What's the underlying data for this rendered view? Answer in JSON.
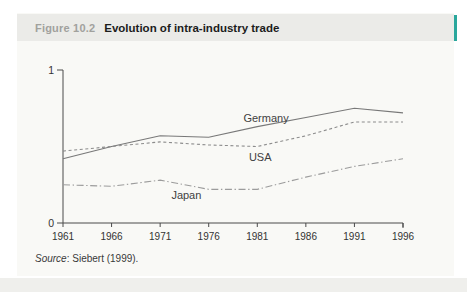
{
  "header": {
    "figure_label": "Figure 10.2",
    "title": "Evolution of intra-industry trade"
  },
  "source": {
    "label": "Source",
    "rest": ": Siebert (1999)."
  },
  "colors": {
    "accent_teal": "#2aa79c",
    "header_bg": "#ebebe8",
    "card_bg": "#f9f9f6",
    "axis": "#4a4a4a",
    "tick_label": "#333333",
    "series_label": "#3f3f3f"
  },
  "chart_data": {
    "type": "line",
    "title": "Evolution of intra-industry trade",
    "xlabel": "",
    "ylabel": "",
    "categories": [
      1961,
      1966,
      1971,
      1976,
      1981,
      1986,
      1991,
      1996
    ],
    "series": [
      {
        "name": "Germany",
        "style": "solid",
        "color": "#787878",
        "values": [
          0.42,
          0.5,
          0.57,
          0.56,
          0.63,
          0.69,
          0.75,
          0.72
        ],
        "label_at": {
          "year": 1981.9,
          "value": 0.68
        }
      },
      {
        "name": "USA",
        "style": "dashed",
        "color": "#8c8c8c",
        "values": [
          0.47,
          0.5,
          0.53,
          0.51,
          0.5,
          0.57,
          0.66,
          0.66
        ],
        "label_at": {
          "year": 1981.3,
          "value": 0.43
        }
      },
      {
        "name": "Japan",
        "style": "dashdot",
        "color": "#9c9c9c",
        "values": [
          0.25,
          0.24,
          0.28,
          0.22,
          0.22,
          0.3,
          0.37,
          0.42
        ],
        "label_at": {
          "year": 1973.7,
          "value": 0.18
        }
      }
    ],
    "xlim": [
      1961,
      1996
    ],
    "ylim": [
      0,
      1
    ],
    "yticks": [
      0,
      1
    ],
    "grid": false,
    "legend": "inline-labels"
  }
}
